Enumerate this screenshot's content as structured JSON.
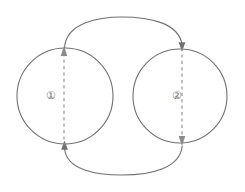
{
  "figure": {
    "type": "diagram",
    "background_color": "#ffffff",
    "stroke_color": "#707070",
    "dashed_stroke_color": "#8a8a8a",
    "label_color": "#6b6b6b"
  },
  "nodes": [
    {
      "id": "node-1",
      "label": "①",
      "label_text": "circled-digit-one",
      "shape": "circle",
      "center_x": 65,
      "center_y": 96,
      "radius": 48
    },
    {
      "id": "node-2",
      "label": "②",
      "label_text": "circled-digit-two",
      "shape": "circle",
      "center_x": 180,
      "center_y": 96,
      "radius": 47
    }
  ],
  "internal_arrows": [
    {
      "id": "arrow-up-node-1",
      "style": "dashed",
      "direction": "up",
      "x": 64,
      "y_start": 144,
      "y_end": 48
    },
    {
      "id": "arrow-down-node-2",
      "style": "dashed",
      "direction": "down",
      "x": 182,
      "y_start": 49,
      "y_end": 144
    }
  ],
  "connector_arcs": [
    {
      "id": "arc-top",
      "style": "solid",
      "from": "node-1-top",
      "to": "node-2-top",
      "direction": "left-to-right",
      "apex_y": 20
    },
    {
      "id": "arc-bottom",
      "style": "solid",
      "from": "node-2-bottom",
      "to": "node-1-bottom",
      "direction": "right-to-left",
      "apex_y": 174
    }
  ]
}
